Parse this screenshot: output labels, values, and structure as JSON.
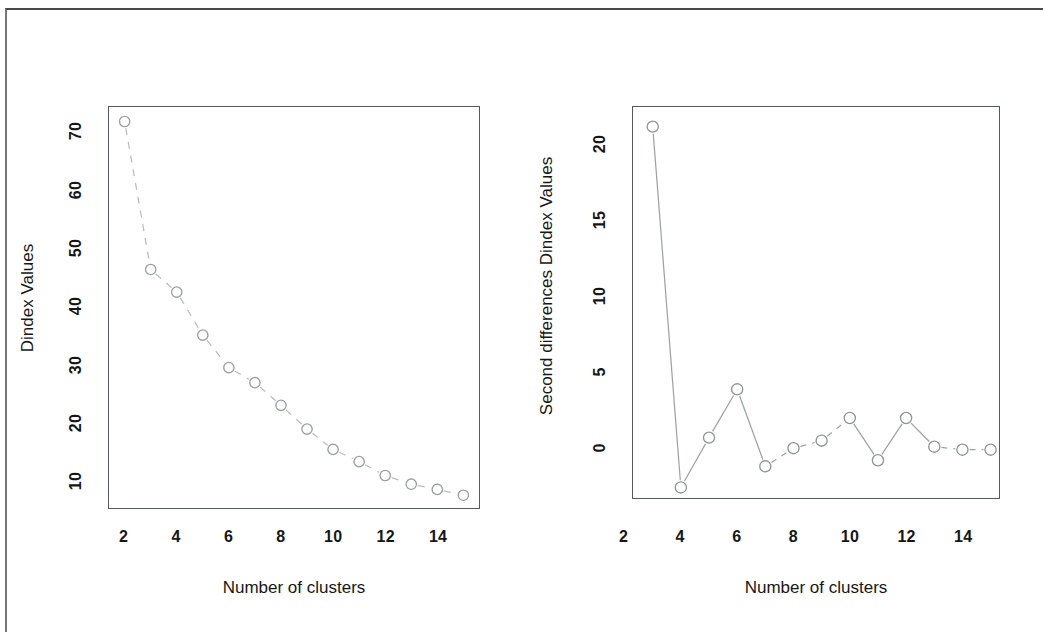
{
  "figure": {
    "background_color": "#ffffff",
    "frame_color": "#4a4a4a",
    "panel_count": 2
  },
  "panels": [
    {
      "id": "dindex",
      "axis": {
        "xlabel": "Number of clusters",
        "ylabel": "Dindex Values",
        "xticks": [
          "2",
          "4",
          "6",
          "8",
          "10",
          "12",
          "14"
        ],
        "yticks": [
          "10",
          "20",
          "30",
          "40",
          "50",
          "60",
          "70"
        ]
      }
    },
    {
      "id": "second-differences",
      "axis": {
        "xlabel": "Number of clusters",
        "ylabel": "Second differences Dindex Values",
        "xticks": [
          "2",
          "4",
          "6",
          "8",
          "10",
          "12",
          "14"
        ],
        "yticks": [
          "0",
          "5",
          "10",
          "15",
          "20"
        ]
      }
    }
  ],
  "chart_data": [
    {
      "type": "line",
      "id": "dindex",
      "title": "",
      "xlabel": "Number of clusters",
      "ylabel": "Dindex Values",
      "xlim": [
        1.4,
        15.6
      ],
      "ylim": [
        5.4,
        74.5
      ],
      "xticks": [
        2,
        4,
        6,
        8,
        10,
        12,
        14
      ],
      "yticks": [
        10,
        20,
        30,
        40,
        50,
        60,
        70
      ],
      "grid": false,
      "legend": null,
      "marker": "open-circle",
      "linestyle": "dashed",
      "line_color": "#b9bcbe",
      "marker_color": "#9aa0a4",
      "x": [
        2,
        3,
        4,
        5,
        6,
        7,
        8,
        9,
        10,
        11,
        12,
        13,
        14,
        15
      ],
      "values": [
        72.0,
        46.5,
        42.6,
        35.2,
        29.6,
        27.0,
        23.1,
        19.0,
        15.5,
        13.4,
        11.0,
        9.5,
        8.6,
        7.6
      ]
    },
    {
      "type": "line",
      "id": "second-differences",
      "title": "",
      "xlabel": "Number of clusters",
      "ylabel": "Second differences Dindex Values",
      "xlim": [
        2.3,
        15.3
      ],
      "ylim": [
        -3.3,
        22.6
      ],
      "xticks": [
        2,
        4,
        6,
        8,
        10,
        12,
        14
      ],
      "yticks": [
        0,
        5,
        10,
        15,
        20
      ],
      "grid": false,
      "legend": null,
      "marker": "open-circle",
      "linestyle": "solid-dashed",
      "line_color": "#9ea2a5",
      "marker_color": "#8f9498",
      "x": [
        3,
        4,
        5,
        6,
        7,
        8,
        9,
        10,
        11,
        12,
        13,
        14,
        15
      ],
      "values": [
        21.3,
        -2.6,
        0.7,
        3.9,
        -1.2,
        0.0,
        0.5,
        2.0,
        -0.8,
        2.0,
        0.1,
        -0.1,
        -0.1
      ]
    }
  ]
}
